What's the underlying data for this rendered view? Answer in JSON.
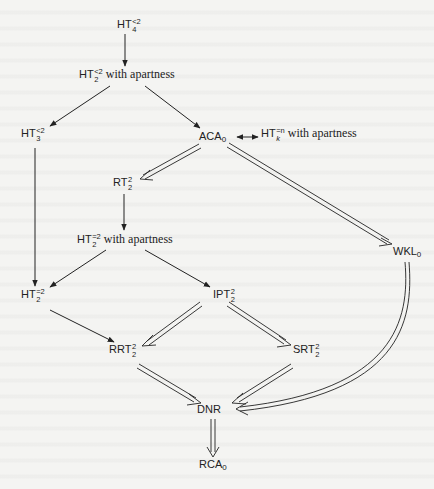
{
  "diagram": {
    "nodes": [
      {
        "id": "ht4",
        "base": "HT",
        "sup": "<2",
        "sub": "4",
        "suffix": "",
        "x": 117,
        "y": 22
      },
      {
        "id": "ht2_apart",
        "base": "HT",
        "sup": "<2",
        "sub": "2",
        "suffix": "with apartness",
        "x": 79,
        "y": 72
      },
      {
        "id": "ht3",
        "base": "HT",
        "sup": "<2",
        "sub": "3",
        "suffix": "",
        "x": 21,
        "y": 131
      },
      {
        "id": "aca0",
        "base": "ACA",
        "sup": "",
        "sub": "0",
        "suffix": "",
        "x": 199,
        "y": 133
      },
      {
        "id": "htk",
        "base": "HT",
        "sup": "=n",
        "sub": "k",
        "suffix": "with apartness",
        "x": 261,
        "y": 131
      },
      {
        "id": "rt22",
        "base": "RT",
        "sup": "2",
        "sub": "2",
        "suffix": "",
        "x": 113,
        "y": 180
      },
      {
        "id": "ht22eq_apart",
        "base": "HT",
        "sup": "=2",
        "sub": "2",
        "suffix": "with apartness",
        "x": 77,
        "y": 237
      },
      {
        "id": "wkl0",
        "base": "WKL",
        "sup": "",
        "sub": "0",
        "suffix": "",
        "x": 395,
        "y": 247
      },
      {
        "id": "ht22eq",
        "base": "HT",
        "sup": "=2",
        "sub": "2",
        "suffix": "",
        "x": 21,
        "y": 292
      },
      {
        "id": "ipt22",
        "base": "IPT",
        "sup": "2",
        "sub": "2",
        "suffix": "",
        "x": 213,
        "y": 292
      },
      {
        "id": "rrt22",
        "base": "RRT",
        "sup": "2",
        "sub": "2",
        "suffix": "",
        "x": 110,
        "y": 347
      },
      {
        "id": "srt22",
        "base": "SRT",
        "sup": "2",
        "sub": "2",
        "suffix": "",
        "x": 293,
        "y": 347
      },
      {
        "id": "dnr",
        "base": "DNR",
        "sup": "",
        "sub": "",
        "suffix": "",
        "x": 197,
        "y": 407
      },
      {
        "id": "rca0",
        "base": "RCA",
        "sup": "",
        "sub": "0",
        "suffix": "",
        "x": 201,
        "y": 461
      }
    ],
    "edges": [
      {
        "from": "ht4",
        "to": "ht2_apart",
        "type": "single"
      },
      {
        "from": "ht2_apart",
        "to": "ht3",
        "type": "single"
      },
      {
        "from": "ht2_apart",
        "to": "aca0",
        "type": "single"
      },
      {
        "from": "aca0",
        "to": "htk",
        "type": "bidirectional"
      },
      {
        "from": "aca0",
        "to": "rt22",
        "type": "double"
      },
      {
        "from": "aca0",
        "to": "wkl0",
        "type": "double"
      },
      {
        "from": "rt22",
        "to": "ht22eq_apart",
        "type": "single"
      },
      {
        "from": "ht3",
        "to": "ht22eq",
        "type": "single"
      },
      {
        "from": "ht22eq_apart",
        "to": "ht22eq",
        "type": "single"
      },
      {
        "from": "ht22eq_apart",
        "to": "ipt22",
        "type": "single"
      },
      {
        "from": "ht22eq",
        "to": "rrt22",
        "type": "single"
      },
      {
        "from": "ipt22",
        "to": "rrt22",
        "type": "double"
      },
      {
        "from": "ipt22",
        "to": "srt22",
        "type": "double"
      },
      {
        "from": "rrt22",
        "to": "dnr",
        "type": "double"
      },
      {
        "from": "srt22",
        "to": "dnr",
        "type": "double"
      },
      {
        "from": "wkl0",
        "to": "dnr",
        "type": "double-curved"
      },
      {
        "from": "dnr",
        "to": "rca0",
        "type": "double"
      }
    ],
    "colors": {
      "ink": "#222222",
      "paper": "#f4f4f2"
    }
  }
}
